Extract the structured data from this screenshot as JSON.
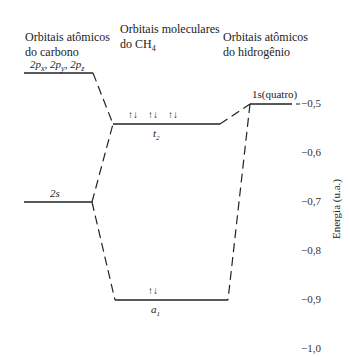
{
  "headers": {
    "carbon_line1": "Orbitais atômicos",
    "carbon_line2": "do carbono",
    "molecular_line1": "Orbitais moleculares",
    "molecular_line2": "do CH",
    "molecular_sub": "4",
    "hydrogen_line1": "Orbitais atômicos",
    "hydrogen_line2": "do hidrogênio"
  },
  "levels": {
    "c_2p": {
      "label": "2p",
      "sub_x": "x",
      "sub_y": "y",
      "sub_z": "z",
      "energy": -0.44
    },
    "c_2s": {
      "label": "2s",
      "energy": -0.7
    },
    "mo_t2": {
      "label": "t",
      "sub": "2",
      "electrons": "↑↓ ↑↓ ↑↓",
      "energy": -0.54
    },
    "mo_a1": {
      "label": "a",
      "sub": "1",
      "electrons": "↑↓",
      "energy": -0.9
    },
    "h_1s": {
      "label": "1s(quatro)",
      "energy": -0.5
    }
  },
  "axis": {
    "label": "Energia (u.a.)",
    "ticks": [
      "−0,5",
      "−0,6",
      "−0,7",
      "−0,8",
      "−0,9",
      "−1,0"
    ]
  },
  "colors": {
    "line": "#222222",
    "background": "#ffffff"
  }
}
